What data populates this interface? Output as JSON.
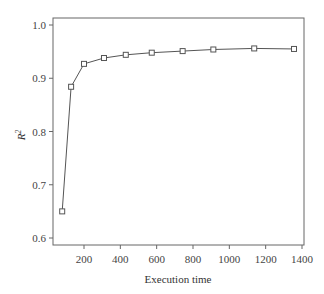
{
  "chart_data": {
    "type": "line",
    "title": "",
    "xlabel": "Execution time",
    "ylabel": "R²",
    "ylabel_base": "R",
    "ylabel_sup": "2",
    "xlim": [
      30,
      1400
    ],
    "ylim": [
      0.585,
      1.02
    ],
    "xticks": [
      200,
      400,
      600,
      800,
      1000,
      1200,
      1400
    ],
    "yticks": [
      0.6,
      0.7,
      0.8,
      0.9,
      1.0
    ],
    "ytick_labels": [
      "0.6",
      "0.7",
      "0.8",
      "0.9",
      "1.0"
    ],
    "grid": false,
    "legend": null,
    "series": [
      {
        "name": "R2",
        "marker": "square",
        "color": "#555555",
        "x": [
          80,
          129,
          200,
          310,
          430,
          573,
          743,
          912,
          1137,
          1356
        ],
        "y": [
          0.65,
          0.884,
          0.927,
          0.938,
          0.944,
          0.948,
          0.951,
          0.954,
          0.956,
          0.955
        ]
      }
    ]
  }
}
